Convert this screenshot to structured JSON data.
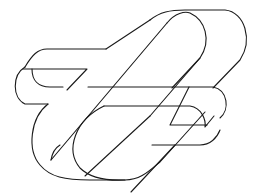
{
  "figure": {
    "title": "Interlocking impossible ribbon figure",
    "type": "line-art",
    "stroke_color": "#1a1a1a",
    "background": "#ffffff",
    "stroke_width": 1.1
  }
}
